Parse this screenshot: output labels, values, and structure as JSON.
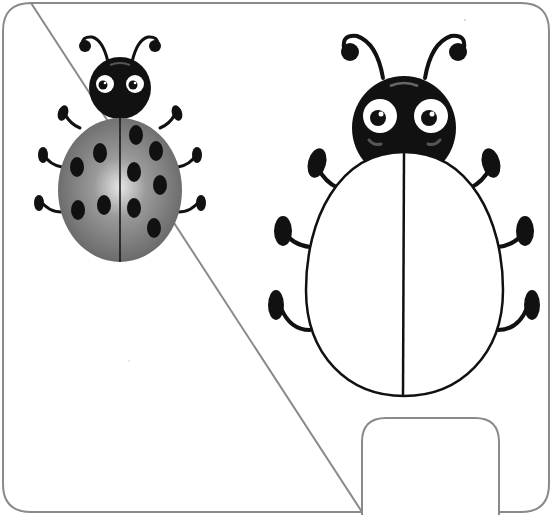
{
  "page": {
    "title": "Ladybug coloring worksheet"
  },
  "colors": {
    "frame_stroke": "#8a8a8a",
    "ink": "#111111",
    "example_shell_light": "#d8d8d8",
    "example_shell_dark": "#6e6e6e",
    "background": "#ffffff"
  },
  "example_ladybug": {
    "label": "example-colored-ladybug",
    "spots": 12
  },
  "outline_ladybug": {
    "label": "outline-ladybug-to-color"
  },
  "tab": {
    "label": "bottom-tab"
  }
}
